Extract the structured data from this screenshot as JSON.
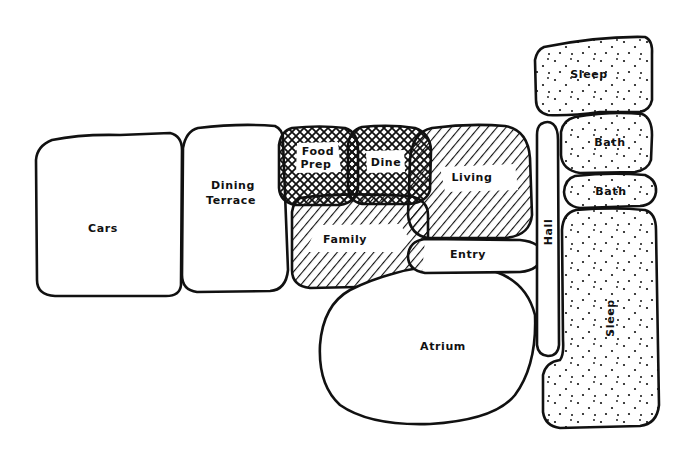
{
  "diagram": {
    "type": "bubble adjacency diagram",
    "legend": {
      "crosshatch": "Food Prep / Dine",
      "diagonal": "Living / Family",
      "stipple": "Sleep / Bath",
      "plain": "Cars / Dining Terrace / Entry / Atrium / Hall"
    },
    "spaces": {
      "cars": "Cars",
      "dining_terrace_1": "Dining",
      "dining_terrace_2": "Terrace",
      "food_prep_1": "Food",
      "food_prep_2": "Prep",
      "dine": "Dine",
      "living": "Living",
      "family": "Family",
      "entry": "Entry",
      "atrium": "Atrium",
      "hall": "Hall",
      "sleep_top": "Sleep",
      "bath_1": "Bath",
      "bath_2": "Bath",
      "sleep_bottom": "Sleep"
    },
    "colors": {
      "ink": "#111111",
      "paper": "#ffffff"
    }
  }
}
